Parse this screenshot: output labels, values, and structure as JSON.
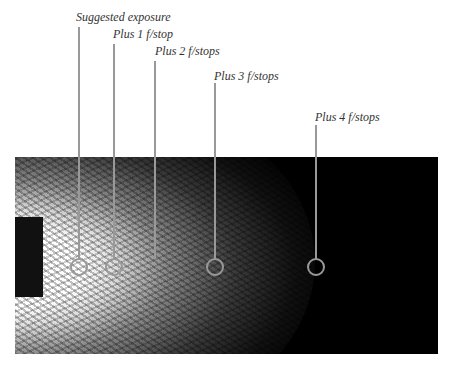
{
  "labels": [
    {
      "text": "Suggested exposure"
    },
    {
      "text": "Plus 1 f/stop"
    },
    {
      "text": "Plus 2 f/stops"
    },
    {
      "text": "Plus 3 f/stops"
    },
    {
      "text": "Plus 4 f/stops"
    }
  ],
  "colors": {
    "callout": "#999999",
    "label": "#333333",
    "photo_bg": "#000000"
  }
}
